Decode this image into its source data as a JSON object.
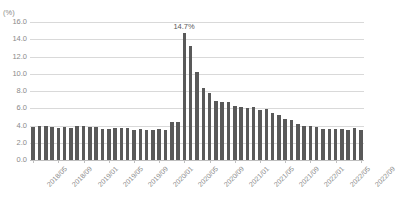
{
  "chart_data": {
    "type": "bar",
    "title": "",
    "clipped_title_hint": "",
    "unit_label": "(%)",
    "xlabel": "",
    "ylabel": "",
    "ylim": [
      0.0,
      16.0
    ],
    "yticks": [
      "0.0",
      "2.0",
      "4.0",
      "6.0",
      "8.0",
      "10.0",
      "12.0",
      "14.0",
      "16.0"
    ],
    "ytick_values": [
      0.0,
      2.0,
      4.0,
      6.0,
      8.0,
      10.0,
      12.0,
      14.0,
      16.0
    ],
    "grid": true,
    "legend": "none",
    "bar_color": "#595959",
    "grid_color": "#d9d9d9",
    "axis_color": "#bfbfbf",
    "text_color": "#8a8a8a",
    "annotations": [
      {
        "label": "14.7%",
        "category": "2020/05",
        "value": 14.7
      }
    ],
    "xtick_labels": [
      "2018/05",
      "2018/09",
      "2019/01",
      "2019/05",
      "2019/09",
      "2020/01",
      "2020/05",
      "2020/09",
      "2021/01",
      "2021/05",
      "2021/09",
      "2022/01",
      "2022/05",
      "2022/09"
    ],
    "xtick_indices": [
      0,
      4,
      8,
      12,
      16,
      20,
      24,
      28,
      32,
      36,
      40,
      44,
      48,
      52
    ],
    "categories": [
      "2018/05",
      "2018/06",
      "2018/07",
      "2018/08",
      "2018/09",
      "2018/10",
      "2018/11",
      "2018/12",
      "2019/01",
      "2019/02",
      "2019/03",
      "2019/04",
      "2019/05",
      "2019/06",
      "2019/07",
      "2019/08",
      "2019/09",
      "2019/10",
      "2019/11",
      "2019/12",
      "2020/01",
      "2020/02",
      "2020/03",
      "2020/04",
      "2020/05",
      "2020/06",
      "2020/07",
      "2020/08",
      "2020/09",
      "2020/10",
      "2020/11",
      "2020/12",
      "2021/01",
      "2021/02",
      "2021/03",
      "2021/04",
      "2021/05",
      "2021/06",
      "2021/07",
      "2021/08",
      "2021/09",
      "2021/10",
      "2021/11",
      "2021/12",
      "2022/01",
      "2022/02",
      "2022/03",
      "2022/04",
      "2022/05",
      "2022/06",
      "2022/07",
      "2022/08",
      "2022/09"
    ],
    "values": [
      3.8,
      4.0,
      3.9,
      3.8,
      3.7,
      3.8,
      3.7,
      3.9,
      4.0,
      3.8,
      3.8,
      3.6,
      3.6,
      3.7,
      3.7,
      3.7,
      3.5,
      3.6,
      3.5,
      3.5,
      3.6,
      3.5,
      4.4,
      4.4,
      14.7,
      13.2,
      10.2,
      8.4,
      7.8,
      6.9,
      6.7,
      6.7,
      6.3,
      6.2,
      6.0,
      6.1,
      5.8,
      5.9,
      5.4,
      5.2,
      4.8,
      4.6,
      4.2,
      3.9,
      4.0,
      3.8,
      3.6,
      3.6,
      3.6,
      3.6,
      3.5,
      3.7,
      3.5
    ],
    "peak_annotation_index": 24
  }
}
